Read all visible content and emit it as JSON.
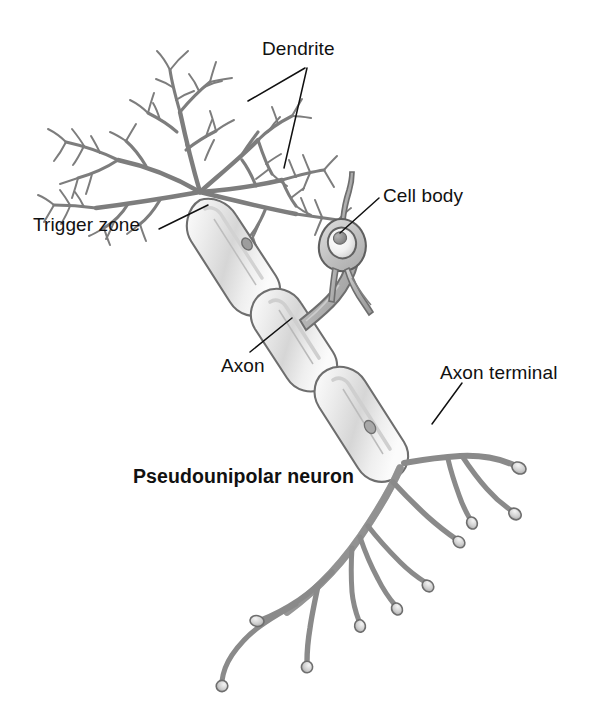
{
  "figure": {
    "title": "Pseudounipolar neuron",
    "canvas": {
      "width": 598,
      "height": 715
    },
    "background_color": "#ffffff"
  },
  "labels": {
    "dendrite": "Dendrite",
    "cell_body": "Cell body",
    "trigger_zone": "Trigger zone",
    "axon": "Axon",
    "axon_terminal": "Axon terminal",
    "title": "Pseudounipolar neuron"
  },
  "colors": {
    "text": "#111111",
    "leader_line": "#111111",
    "outline": "#6e6e6e",
    "outline_dark": "#4a4a4a",
    "myelin_fill": "#ebebeb",
    "myelin_shade": "#cfcfcf",
    "soma_fill": "#c9c9c9",
    "nucleus_fill": "#f2f2f2",
    "nucleolus_fill": "#8a8a8a",
    "process_fill": "#b8b8b8",
    "dendrite_stroke": "#7a7a7a"
  },
  "parts": [
    {
      "name": "dendrite-tree",
      "label": "Dendrite",
      "description": "feathery branching dendritic arbor at upper left with fine spine-like twigs"
    },
    {
      "name": "trigger-zone",
      "label": "Trigger zone",
      "description": "axon hillock where dendrites converge into the first myelinated segment"
    },
    {
      "name": "myelin-segment-1",
      "label": "Axon",
      "description": "first myelin sheath internode"
    },
    {
      "name": "myelin-segment-2",
      "label": "Axon",
      "description": "second myelin sheath internode at the T-junction with the cell body stalk"
    },
    {
      "name": "myelin-segment-3",
      "label": "Axon",
      "description": "third myelin sheath internode leading to the terminal arbor"
    },
    {
      "name": "cell-body",
      "label": "Cell body",
      "description": "spindle-shaped soma on a short stalk containing nucleus and nucleolus"
    },
    {
      "name": "axon-terminal-arbor",
      "label": "Axon terminal",
      "description": "branching terminal arbor ending in bulbous synaptic knobs"
    }
  ],
  "leader_lines": [
    {
      "name": "dendrite-leader-left",
      "from": [
        305,
        68
      ],
      "to": [
        248,
        101
      ]
    },
    {
      "name": "dendrite-leader-right",
      "from": [
        307,
        68
      ],
      "to": [
        284,
        168
      ]
    },
    {
      "name": "cell-body-leader",
      "from": [
        379,
        198
      ],
      "to": [
        340,
        233
      ]
    },
    {
      "name": "trigger-zone-leader",
      "from": [
        159,
        229
      ],
      "to": [
        208,
        205
      ]
    },
    {
      "name": "axon-leader",
      "from": [
        250,
        352
      ],
      "to": [
        292,
        318
      ]
    },
    {
      "name": "axon-terminal-leader",
      "from": [
        462,
        383
      ],
      "to": [
        432,
        424
      ]
    }
  ],
  "terminal_bouton_count": 10
}
